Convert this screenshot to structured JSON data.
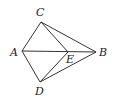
{
  "diagram": {
    "points": {
      "A": {
        "label": "A",
        "x": 22,
        "y": 51,
        "lx": 11,
        "ly": 56
      },
      "B": {
        "label": "B",
        "x": 96,
        "y": 52,
        "lx": 99,
        "ly": 56
      },
      "C": {
        "label": "C",
        "x": 41,
        "y": 22,
        "lx": 36,
        "ly": 16
      },
      "D": {
        "label": "D",
        "x": 40,
        "y": 82,
        "lx": 35,
        "ly": 94
      },
      "E": {
        "label": "E",
        "x": 68,
        "y": 52,
        "lx": 66,
        "ly": 63
      }
    },
    "segments": [
      [
        "C",
        "A"
      ],
      [
        "C",
        "B"
      ],
      [
        "C",
        "E"
      ],
      [
        "A",
        "B"
      ],
      [
        "A",
        "D"
      ],
      [
        "D",
        "E"
      ],
      [
        "D",
        "B"
      ]
    ]
  }
}
